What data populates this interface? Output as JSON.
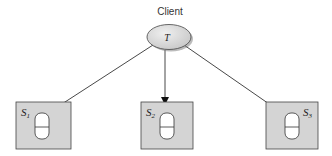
{
  "diagram": {
    "client": {
      "label": "Client",
      "node_label": "T"
    },
    "servers": [
      {
        "label": "S",
        "sub": "1"
      },
      {
        "label": "S",
        "sub": "2"
      },
      {
        "label": "S",
        "sub": "3"
      }
    ],
    "colors": {
      "box_fill": "#d4d4d4",
      "ellipse_fill": "#dcdcdc",
      "stroke": "#333333"
    }
  }
}
